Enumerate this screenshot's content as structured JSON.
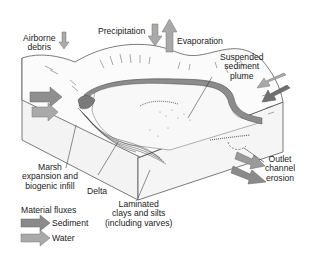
{
  "diagram": {
    "labels": {
      "airborne_debris": [
        "Airborne",
        "debris"
      ],
      "precipitation": "Precipitation",
      "evaporation": "Evaporation",
      "suspended_plume": [
        "Suspended",
        "sediment",
        "plume"
      ],
      "marsh": [
        "Marsh",
        "expansion and",
        "biogenic infill"
      ],
      "delta": "Delta",
      "laminated": [
        "Laminated",
        "clays and silts",
        "(including varves)"
      ],
      "outlet": [
        "Outlet",
        "channel",
        "erosion"
      ]
    },
    "legend": {
      "title": "Material fluxes",
      "items": [
        {
          "label": "Sediment",
          "icon": "sediment-arrow-icon",
          "color": "#8a8a8a"
        },
        {
          "label": "Water",
          "icon": "water-arrow-icon",
          "color": "#a8a8a8"
        }
      ]
    },
    "colors": {
      "sediment_arrow": "#8a8a8a",
      "water_arrow": "#a9a9a9",
      "dark_arrow": "#6f6f6f",
      "littoral_band": "#8c8c8c",
      "block_face": "#f2f2f2",
      "line": "#3a3a3a"
    }
  }
}
